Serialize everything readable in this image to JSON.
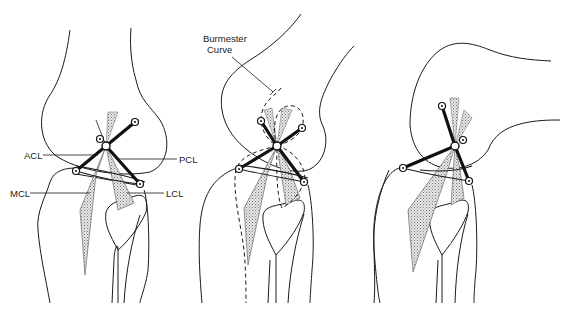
{
  "figure": {
    "panels": [
      {
        "id": "left",
        "labels": {
          "acl": "ACL",
          "pcl": "PCL",
          "mcl": "MCL",
          "lcl": "LCL"
        }
      },
      {
        "id": "middle",
        "labels": {
          "burmester_line1": "Burmester",
          "burmester_line2": "Curve"
        }
      },
      {
        "id": "right",
        "labels": {}
      }
    ],
    "colors": {
      "line": "#1a1a1a",
      "ligament_fill": "#c8c8c8",
      "background": "#ffffff"
    }
  }
}
